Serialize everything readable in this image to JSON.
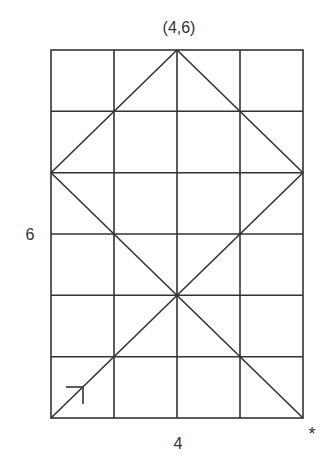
{
  "diagram": {
    "type": "grid-path-diagram",
    "grid": {
      "columns": 4,
      "rows": 6
    },
    "labels": {
      "top": "(4,6)",
      "left": "6",
      "bottom": "4",
      "corner_mark": "*"
    },
    "line_color": "#333333",
    "diagonals": [
      {
        "from": [
          0,
          0
        ],
        "to": [
          4,
          4
        ]
      },
      {
        "from": [
          0,
          4
        ],
        "to": [
          4,
          0
        ]
      },
      {
        "from": [
          0,
          4
        ],
        "to": [
          2,
          6
        ]
      },
      {
        "from": [
          2,
          6
        ],
        "to": [
          4,
          4
        ]
      }
    ],
    "start_arrow": {
      "at": [
        0,
        0
      ],
      "direction": "up-right",
      "icon": "arrow-icon"
    }
  }
}
